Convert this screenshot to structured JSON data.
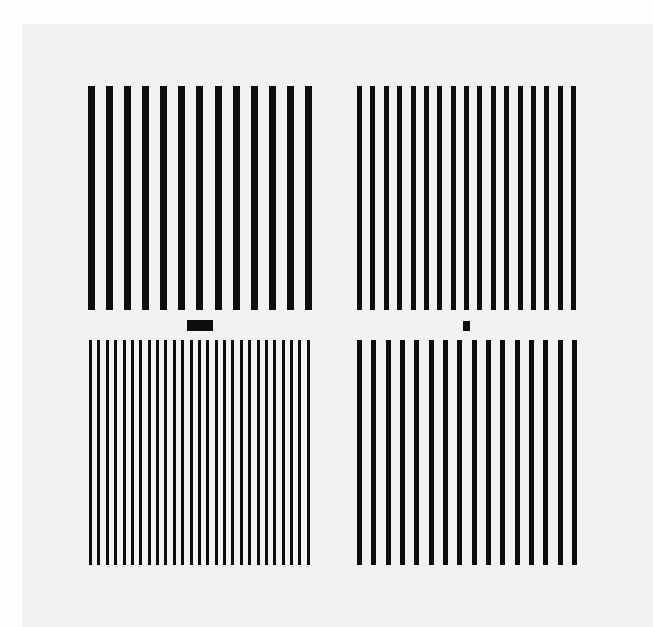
{
  "figure": {
    "background_color": "#f2f2f2",
    "bar_color": "#0d0d0d",
    "panels": [
      {
        "id": "top-left",
        "x": 88,
        "y": 86,
        "width": 224,
        "height": 224,
        "bar_count": 13,
        "bar_width": 7
      },
      {
        "id": "top-right",
        "x": 357,
        "y": 86,
        "width": 219,
        "height": 224,
        "bar_count": 17,
        "bar_width": 5
      },
      {
        "id": "bottom-left",
        "x": 89,
        "y": 340,
        "width": 221,
        "height": 225,
        "bar_count": 27,
        "bar_width": 3
      },
      {
        "id": "bottom-right",
        "x": 357,
        "y": 340,
        "width": 220,
        "height": 225,
        "bar_count": 16,
        "bar_width": 5
      }
    ],
    "markers": [
      {
        "id": "marker-left",
        "x": 187,
        "y": 320,
        "width": 26,
        "height": 11
      },
      {
        "id": "marker-right",
        "x": 463,
        "y": 321,
        "width": 7,
        "height": 10
      }
    ]
  }
}
